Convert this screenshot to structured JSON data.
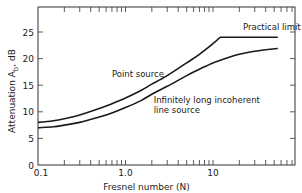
{
  "chart_data": {
    "type": "line",
    "title": "",
    "xlabel": "Fresnel number (N)",
    "ylabel": "Attenuation A_b, dB",
    "x_scale": "log",
    "xlim": [
      0.1,
      90
    ],
    "ylim": [
      0,
      29
    ],
    "x_tick_labels": [
      "0.1",
      "1.0",
      "10"
    ],
    "y_ticks": [
      0,
      5,
      10,
      15,
      20,
      25
    ],
    "grid": false,
    "legend": "none (inline annotations)",
    "series": [
      {
        "name": "Point source",
        "x": [
          0.1,
          0.15,
          0.2,
          0.3,
          0.5,
          0.7,
          1.0,
          1.5,
          2.0,
          3.0,
          5.0,
          7.0,
          10.0,
          12.0,
          20.0,
          30.0,
          55.0
        ],
        "y": [
          8.0,
          8.3,
          8.7,
          9.4,
          10.6,
          11.5,
          12.6,
          14.0,
          15.2,
          16.8,
          19.2,
          20.8,
          22.8,
          24.0,
          24.0,
          24.0,
          24.0
        ]
      },
      {
        "name": "Infinitely long incoherent line source",
        "x": [
          0.1,
          0.15,
          0.2,
          0.3,
          0.5,
          0.7,
          1.0,
          1.5,
          2.0,
          3.0,
          5.0,
          7.0,
          10.0,
          15.0,
          20.0,
          30.0,
          55.0
        ],
        "y": [
          7.0,
          7.2,
          7.5,
          8.0,
          9.0,
          9.8,
          10.8,
          12.1,
          13.3,
          14.8,
          16.8,
          18.0,
          19.2,
          20.2,
          20.8,
          21.4,
          21.9
        ]
      }
    ],
    "annotations": [
      {
        "text": "Practical limit",
        "x": 22,
        "y": 25.3
      },
      {
        "text": "Point source",
        "x": 0.7,
        "y": 16.6
      },
      {
        "text": "Infinitely long incoherent",
        "x": 2.1,
        "y": 11.6
      },
      {
        "text": "line source",
        "x": 2.1,
        "y": 9.8
      }
    ]
  },
  "labels": {
    "xlabel": "Fresnel number (N)",
    "ylabel": "Attenuation  A",
    "ylabel_sub": "b",
    "ylabel_unit": ", dB"
  }
}
